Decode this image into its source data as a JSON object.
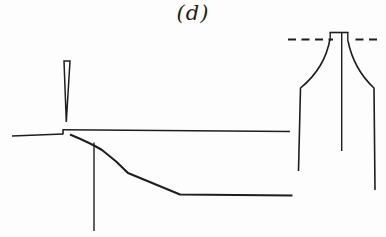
{
  "figure": {
    "label": "(d)",
    "background_color": "#fdfdfd",
    "stroke_color": "#1e1e1e"
  },
  "left_diagram": {
    "wedge_indenter_path": "M64,61 L70,61 L66.3,122 Z",
    "left_surface_path": "M12,136 L63,134",
    "surface_step_path": "M63,134.5 L63,129.2",
    "upper_surface_path": "M63,129.8 L290,131.5",
    "fracture_curve_path": "M70,134.5 C82,139.5 93,144.5 102,150 C110,156 119,163.5 128,173 L180,194.5 L292.5,195.5",
    "median_crack_path": "M94,142.5 L94,231"
  },
  "right_diagram": {
    "datum_dash_left_path": "M288,39.5 L333,39.5",
    "datum_dash_right_path": "M355.5,39.5 L380,39.5",
    "tip_plateau_path": "M329.5,32.5 L348.5,32.5",
    "tip_left_tick_path": "M330.2,32.5 L330.2,40.5",
    "tip_right_tick_path": "M347.8,32.5 L347.8,41",
    "center_crack_path": "M341.7,33 L341.7,151",
    "left_flank_path": "M330,39 C327,56 319,73 300.5,88 L298.5,171",
    "right_flank_path": "M348,41 C351.5,58 360,75 374,88 L375,190"
  }
}
